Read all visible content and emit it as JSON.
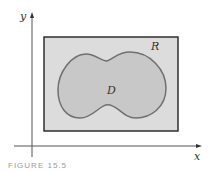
{
  "diagram": {
    "axes": {
      "x_label": "x",
      "y_label": "y"
    },
    "rectangle": {
      "label": "R",
      "fill": "#dcdcdc",
      "stroke": "#222222"
    },
    "region": {
      "label": "D",
      "fill": "#c8c8c8",
      "stroke": "#707070"
    },
    "caption": "FIGURE 15.5"
  }
}
